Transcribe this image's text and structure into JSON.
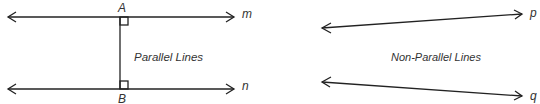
{
  "diagram": {
    "left": {
      "caption": "Parallel Lines",
      "lines": [
        {
          "name": "m"
        },
        {
          "name": "n"
        }
      ],
      "points": [
        {
          "name": "A"
        },
        {
          "name": "B"
        }
      ]
    },
    "right": {
      "caption": "Non-Parallel Lines",
      "lines": [
        {
          "name": "p"
        },
        {
          "name": "q"
        }
      ]
    },
    "colors": {
      "stroke": "#222222",
      "text": "#333333"
    }
  }
}
